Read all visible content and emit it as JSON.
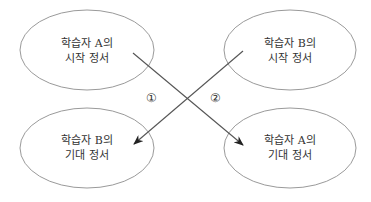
{
  "diagram": {
    "nodes": [
      {
        "id": "a-start",
        "line1": "학습자 A의",
        "line2": "시작 정서"
      },
      {
        "id": "b-start",
        "line1": "학습자 B의",
        "line2": "시작 정서"
      },
      {
        "id": "b-expected",
        "line1": "학습자 B의",
        "line2": "기대 정서"
      },
      {
        "id": "a-expected",
        "line1": "학습자 A의",
        "line2": "기대 정서"
      }
    ],
    "edges": [
      {
        "id": "edge-1",
        "label": "①",
        "from": "a-start",
        "to": "a-expected"
      },
      {
        "id": "edge-2",
        "label": "②",
        "from": "b-start",
        "to": "b-expected"
      }
    ],
    "colors": {
      "ellipse_stroke": "#9a9a9a",
      "arrow": "#555555",
      "text": "#333333"
    }
  }
}
